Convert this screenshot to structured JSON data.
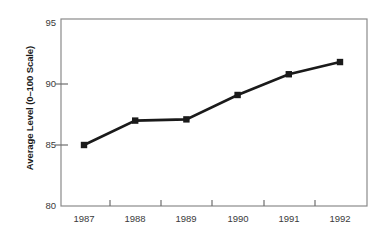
{
  "chart_data": {
    "type": "line",
    "title": "",
    "subtitle": "",
    "xlabel": "",
    "ylabel": "Average Level (0–100 Scale)",
    "categories": [
      "1987",
      "1988",
      "1989",
      "1990",
      "1991",
      "1992"
    ],
    "x": [
      1987,
      1988,
      1989,
      1990,
      1991,
      1992
    ],
    "values": [
      85.0,
      87.0,
      87.1,
      89.1,
      90.8,
      91.8
    ],
    "series": [
      {
        "name": "Average Level",
        "values": [
          85.0,
          87.0,
          87.1,
          89.1,
          90.8,
          91.8
        ],
        "color": "#1a1a1a",
        "marker": "square",
        "marker_color": "#1a1a1a"
      }
    ],
    "ylim": [
      80,
      95
    ],
    "yticks": [
      80,
      85,
      90,
      95
    ],
    "ytick_labels": [
      "80",
      "85",
      "90",
      "95"
    ],
    "xtick_labels": [
      "1987",
      "1988",
      "1989",
      "1990",
      "1991",
      "1992"
    ],
    "grid": false,
    "legend": false,
    "legend_position": "none",
    "annotations": [],
    "frame": {
      "border_color": "#8a8a8a",
      "background": "#ffffff"
    }
  },
  "axes": {
    "y_title": "Average Level (0–100 Scale)",
    "y_labels": [
      "95",
      "90",
      "85",
      "80"
    ],
    "x_labels": [
      "1987",
      "1988",
      "1989",
      "1990",
      "1991",
      "1992"
    ]
  },
  "colors": {
    "line": "#1a1a1a",
    "marker": "#1a1a1a",
    "axis": "#8a8a8a",
    "tick_text": "#3a3a3a",
    "title_text": "#1a1a1a",
    "background": "#ffffff"
  }
}
